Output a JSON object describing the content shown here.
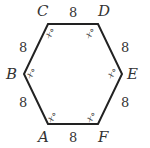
{
  "figure": {
    "type": "regular hexagon",
    "line_color": "#222222",
    "text_color": "#333333",
    "vertices": [
      {
        "id": "A",
        "label": "A",
        "angle_label": "x°"
      },
      {
        "id": "B",
        "label": "B",
        "angle_label": "x°"
      },
      {
        "id": "C",
        "label": "C",
        "angle_label": "x°"
      },
      {
        "id": "D",
        "label": "D",
        "angle_label": "x°"
      },
      {
        "id": "E",
        "label": "E",
        "angle_label": "x°"
      },
      {
        "id": "F",
        "label": "F",
        "angle_label": "x°"
      }
    ],
    "sides": [
      {
        "from": "A",
        "to": "B",
        "length_label": "8"
      },
      {
        "from": "B",
        "to": "C",
        "length_label": "8"
      },
      {
        "from": "C",
        "to": "D",
        "length_label": "8"
      },
      {
        "from": "D",
        "to": "E",
        "length_label": "8"
      },
      {
        "from": "E",
        "to": "F",
        "length_label": "8"
      },
      {
        "from": "F",
        "to": "A",
        "length_label": "8"
      }
    ]
  }
}
